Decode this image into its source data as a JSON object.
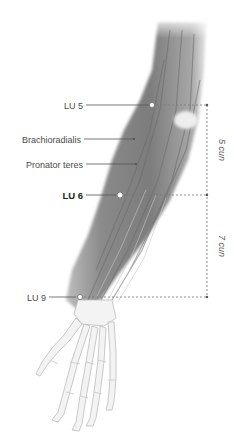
{
  "diagram": {
    "colors": {
      "muscle": "#8e8e8e",
      "muscle_dark": "#6f6f6f",
      "bone": "#f2f2f2",
      "bone_outline": "#c4c4c4",
      "leader": "#555555",
      "dashed": "#777777"
    },
    "labels": {
      "lu5": "LU 5",
      "brachioradialis": "Brachioradialis",
      "pronator_teres": "Pronator teres",
      "lu6": "LU 6",
      "lu9": "LU 9"
    },
    "measurements": {
      "upper": "5 cun",
      "lower": "7 cun"
    },
    "points": [
      {
        "id": "lu5",
        "name": "LU 5",
        "emphasized": false
      },
      {
        "id": "lu6",
        "name": "LU 6",
        "emphasized": true
      },
      {
        "id": "lu9",
        "name": "LU 9",
        "emphasized": false
      }
    ]
  }
}
